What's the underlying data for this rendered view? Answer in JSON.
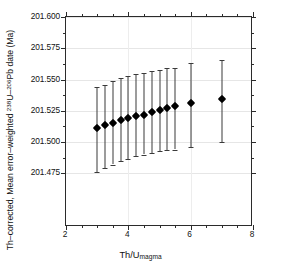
{
  "chart_data": {
    "type": "scatter",
    "title": "",
    "xlabel": "Th/U_magma",
    "xlabel_base": "Th/U",
    "xlabel_sub": "magma",
    "ylabel": "Th-corrected, Mean error-weighted 238U-206Pb date (Ma)",
    "ylabel_parts": {
      "pre": "Th–corrected, Mean error–weighted ",
      "sup1": "238",
      "mid1": "U–",
      "sup2": "206",
      "mid2": "Pb date (Ma)"
    },
    "xlim": [
      2,
      8
    ],
    "ylim": [
      201.432,
      201.6
    ],
    "grid": true,
    "legend": null,
    "xticks": [
      2,
      4,
      6,
      8
    ],
    "xtick_labels": [
      "2",
      "4",
      "6",
      "8"
    ],
    "xticks_minor": [
      2.5,
      3,
      3.5,
      4.5,
      5,
      5.5,
      6.5,
      7,
      7.5
    ],
    "yticks": [
      201.475,
      201.5,
      201.525,
      201.55,
      201.575,
      201.6
    ],
    "ytick_labels": [
      "201.475",
      "201.500",
      "201.525",
      "201.550",
      "201.575",
      "201.600"
    ],
    "yticks_minor": [
      201.4875,
      201.5125,
      201.5375,
      201.5625,
      201.5875
    ],
    "marker_color": "#000000",
    "errorbar_color": "#3a3a3a",
    "series": [
      {
        "name": "Th-corrected mean date",
        "x": [
          3.0,
          3.25,
          3.5,
          3.75,
          4.0,
          4.25,
          4.5,
          4.75,
          5.0,
          5.25,
          5.5,
          6.0,
          7.0
        ],
        "y": [
          201.511,
          201.5135,
          201.5155,
          201.5175,
          201.519,
          201.5205,
          201.522,
          201.524,
          201.5255,
          201.5275,
          201.529,
          201.531,
          201.5345
        ],
        "y_err_lower": [
          201.476,
          201.479,
          201.482,
          201.4845,
          201.4865,
          201.4885,
          201.49,
          201.4915,
          201.4925,
          201.4935,
          201.494,
          201.496,
          201.5
        ],
        "y_err_upper": [
          201.544,
          201.546,
          201.5485,
          201.551,
          201.553,
          201.5545,
          201.5555,
          201.557,
          201.558,
          201.559,
          201.5595,
          201.563,
          201.5655
        ]
      }
    ]
  },
  "axes": {
    "xaxis_name": "th-u-magma-axis",
    "yaxis_name": "date-axis"
  }
}
